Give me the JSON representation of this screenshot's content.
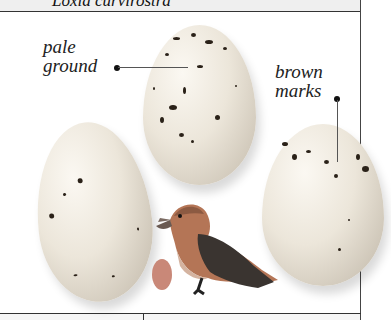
{
  "header": {
    "species": "Loxia curvirostra"
  },
  "annotations": {
    "pale_ground": {
      "line1": "pale",
      "line2": "ground"
    },
    "brown_marks": {
      "line1": "brown",
      "line2": "marks"
    }
  },
  "colors": {
    "egg_ground": "#efe9de",
    "egg_marks": "#2a2118",
    "life_size_egg": "#c98878",
    "bird_head": "#b86a48",
    "bird_wing": "#3a3430",
    "frame": "#333333",
    "header_bg": "#efefef"
  }
}
